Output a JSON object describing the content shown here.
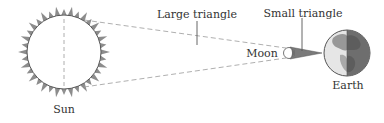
{
  "diagram": {
    "labels": {
      "sun": "Sun",
      "moon": "Moon",
      "earth": "Earth",
      "large_triangle": "Large triangle",
      "small_triangle": "Small triangle"
    },
    "colors": {
      "outline": "#555555",
      "dashed": "#9a9a9a",
      "rays": "#8c8c8c",
      "small_triangle_fill": "#7a7a7a",
      "earth_light": "#e6e6e6",
      "earth_dark": "#6e6e6e",
      "text": "#333333"
    }
  }
}
